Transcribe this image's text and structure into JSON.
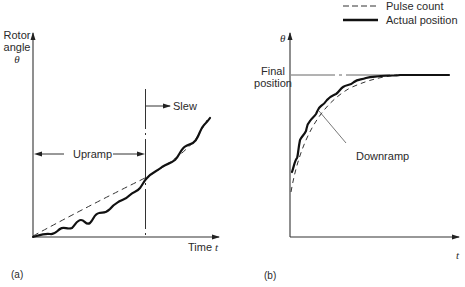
{
  "figure": {
    "panel_a": {
      "tag": "(a)",
      "y_label_line1": "Rotor",
      "y_label_line2": "angle",
      "y_symbol": "θ",
      "x_label": "Time ",
      "x_symbol": "t",
      "annotations": {
        "upramp": "Upramp",
        "slew": "Slew"
      }
    },
    "panel_b": {
      "tag": "(b)",
      "y_symbol": "θ",
      "x_symbol": "t",
      "final_line1": "Final",
      "final_line2": "position",
      "annotations": {
        "downramp": "Downramp"
      }
    },
    "legend": {
      "items": [
        {
          "label": "Pulse count",
          "style": "dashed"
        },
        {
          "label": "Actual position",
          "style": "solid-thick"
        }
      ]
    }
  }
}
